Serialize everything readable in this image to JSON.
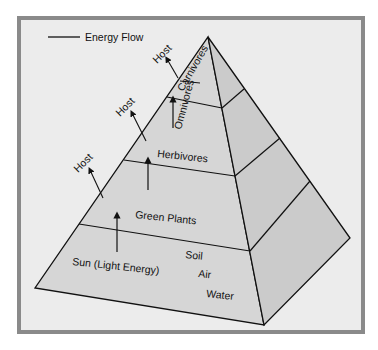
{
  "legend": {
    "label": "Energy Flow"
  },
  "levels": {
    "carnivores": "Carnivores",
    "omnivores": "Omnivores",
    "herbivores": "Herbivores",
    "green_plants": "Green Plants",
    "sun": "Sun (Light Energy)",
    "soil": "Soil",
    "air": "Air",
    "water": "Water"
  },
  "host_labels": [
    "Host",
    "Host",
    "Host"
  ],
  "colors": {
    "face": "#d6d6d6",
    "side": "#c9c9c9",
    "frame": "#8a8a8a",
    "background": "#ececec"
  }
}
